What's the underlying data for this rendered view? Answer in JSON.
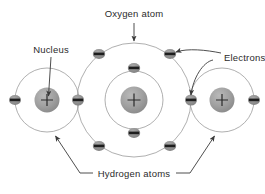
{
  "figure": {
    "background_color": "#ffffff",
    "line_color": "#8c8c8c",
    "leader_color": "#3a3a3a",
    "nucleus_fill": "#9b9b9b",
    "electron_fill": "#8f8f8f",
    "electron_bar_color": "#1e1e1e",
    "text_color": "#2b2b2b"
  },
  "labels": {
    "oxygen": "Oxygen atom",
    "nucleus": "Nucleus",
    "electrons": "Electrons",
    "hydrogen": "Hydrogen atoms"
  },
  "atoms": {
    "oxygen": {
      "name": "Oxygen atom",
      "center": [
        134,
        100
      ],
      "nucleus_symbol": "+",
      "nucleus_radius": 13,
      "shells": [
        {
          "name": "inner-shell",
          "radius": 29,
          "electron_count": 2
        },
        {
          "name": "outer-shell",
          "radius": 57,
          "electron_count": 6
        }
      ]
    },
    "hydrogen_left": {
      "name": "Hydrogen atom left",
      "center": [
        47,
        100
      ],
      "nucleus_symbol": "+",
      "nucleus_radius": 12,
      "shells": [
        {
          "name": "shell",
          "radius": 32,
          "electron_count": 2
        }
      ]
    },
    "hydrogen_right": {
      "name": "Hydrogen atom right",
      "center": [
        222,
        100
      ],
      "nucleus_symbol": "+",
      "nucleus_radius": 12,
      "shells": [
        {
          "name": "shell",
          "radius": 32,
          "electron_count": 2
        }
      ]
    }
  },
  "electrons": {
    "symbol": "−",
    "oxygen_inner": [
      [
        134,
        68
      ],
      [
        134,
        133
      ]
    ],
    "oxygen_outer": [
      [
        99,
        54
      ],
      [
        170,
        54
      ],
      [
        99,
        146
      ],
      [
        170,
        146
      ],
      [
        78,
        100
      ],
      [
        191,
        100
      ]
    ],
    "hydrogen_left": [
      [
        15,
        100
      ],
      [
        78,
        100
      ]
    ],
    "hydrogen_right": [
      [
        191,
        100
      ],
      [
        254,
        100
      ]
    ]
  },
  "annotations": [
    {
      "name": "oxygen-annotation",
      "label": "Oxygen atom",
      "text_pos": [
        134,
        15
      ],
      "arrow_from": [
        134,
        22
      ],
      "arrow_to": [
        134,
        42
      ]
    },
    {
      "name": "nucleus-annotation",
      "label": "Nucleus",
      "text_pos": [
        51,
        50
      ],
      "arrow_from": [
        51,
        56
      ],
      "arrow_to": [
        48,
        97
      ]
    },
    {
      "name": "electrons-annotation",
      "label": "Electrons",
      "text_pos": [
        224,
        58
      ],
      "arrow_to_1": [
        191,
        100
      ],
      "arrow_to_2": [
        172,
        53
      ]
    },
    {
      "name": "hydrogen-annotation",
      "label": "Hydrogen atoms",
      "text_pos": [
        134,
        176
      ],
      "arrow_to_left": [
        53,
        133
      ],
      "arrow_to_right": [
        217,
        133
      ]
    }
  ]
}
